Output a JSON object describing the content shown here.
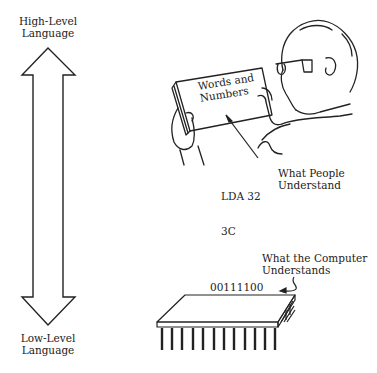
{
  "scale_arrow": {
    "top_label_line1": "High-Level",
    "top_label_line2": "Language",
    "bottom_label_line1": "Low-Level",
    "bottom_label_line2": "Language"
  },
  "person": {
    "book_text_line1": "Words and",
    "book_text_line2": "Numbers",
    "caption_line1": "What People",
    "caption_line2": "Understand"
  },
  "levels": {
    "assembly": "LDA 32",
    "hex": "3C",
    "binary": "00111100"
  },
  "chip": {
    "caption_line1": "What the Computer",
    "caption_line2": "Understands"
  },
  "colors": {
    "line": "#222222",
    "background": "#ffffff"
  }
}
